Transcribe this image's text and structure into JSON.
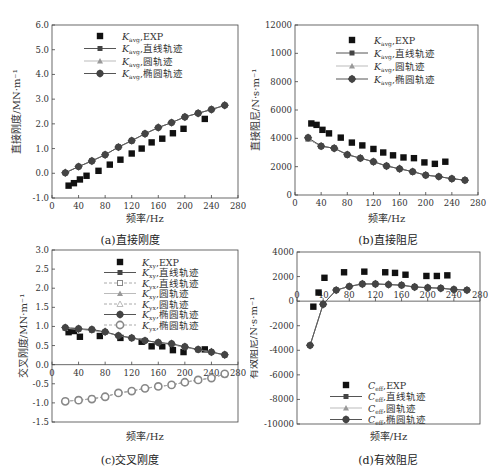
{
  "chart_data": [
    {
      "id": "a",
      "type": "line",
      "caption": "(a)直接刚度",
      "xlabel": "频率/Hz",
      "ylabel": "直接刚度/MN·m⁻¹",
      "xlim": [
        0,
        280
      ],
      "ylim": [
        -1.0,
        6.0
      ],
      "xticks": [
        0,
        40,
        80,
        120,
        160,
        200,
        240,
        280
      ],
      "yticks": [
        -1.0,
        0.0,
        1.0,
        2.0,
        3.0,
        4.0,
        5.0,
        6.0
      ],
      "ytick_labels": [
        "-1.0",
        "0.0",
        "1.0",
        "2.0",
        "3.0",
        "4.0",
        "5.0",
        "6.0"
      ],
      "legend": [
        "K_avg, EXP",
        "K_avg, 直线轨迹",
        "K_avg, 圆轨迹",
        "K_avg, 椭圆轨迹"
      ],
      "series": [
        {
          "name": "K_avg, EXP",
          "style": "square",
          "x": [
            25,
            33,
            42,
            52,
            70,
            87,
            103,
            120,
            135,
            150,
            166,
            182,
            198,
            230
          ],
          "y": [
            -0.5,
            -0.4,
            -0.25,
            -0.1,
            0.1,
            0.35,
            0.55,
            0.8,
            1.0,
            1.25,
            1.4,
            1.62,
            1.8,
            2.2
          ]
        },
        {
          "name": "K_avg, 直线轨迹",
          "style": "line-square",
          "x": [
            20,
            40,
            60,
            80,
            100,
            120,
            140,
            160,
            180,
            200,
            220,
            240,
            260
          ],
          "y": [
            0.02,
            0.27,
            0.5,
            0.75,
            1.06,
            1.32,
            1.6,
            1.85,
            2.05,
            2.28,
            2.43,
            2.58,
            2.75
          ]
        },
        {
          "name": "K_avg, 圆轨迹",
          "style": "line-triangle",
          "x": [
            20,
            40,
            60,
            80,
            100,
            120,
            140,
            160,
            180,
            200,
            220,
            240,
            260
          ],
          "y": [
            0.02,
            0.27,
            0.5,
            0.75,
            1.06,
            1.32,
            1.6,
            1.85,
            2.05,
            2.28,
            2.43,
            2.58,
            2.75
          ]
        },
        {
          "name": "K_avg, 椭圆轨迹",
          "style": "line-diamond",
          "x": [
            20,
            40,
            60,
            80,
            100,
            120,
            140,
            160,
            180,
            200,
            220,
            240,
            260
          ],
          "y": [
            0.02,
            0.27,
            0.5,
            0.75,
            1.06,
            1.32,
            1.6,
            1.85,
            2.05,
            2.28,
            2.43,
            2.58,
            2.75
          ]
        }
      ]
    },
    {
      "id": "b",
      "type": "line",
      "caption": "(b)直接阻尼",
      "xlabel": "频率/Hz",
      "ylabel": "直接阻尼/N·s·m⁻¹",
      "xlim": [
        0,
        280
      ],
      "ylim": [
        0,
        12000
      ],
      "xticks": [
        0,
        40,
        80,
        120,
        160,
        200,
        240,
        280
      ],
      "yticks": [
        0,
        2000,
        4000,
        6000,
        8000,
        10000,
        12000
      ],
      "ytick_labels": [
        "0",
        "2000",
        "4000",
        "6000",
        "8000",
        "1000",
        "12000"
      ],
      "legend": [
        "K_avg, EXP",
        "K_avg, 直线轨迹",
        "K_avg, 圆轨迹",
        "K_avg, 椭圆轨迹"
      ],
      "series": [
        {
          "name": "K_avg, EXP",
          "style": "square",
          "x": [
            25,
            33,
            42,
            52,
            70,
            87,
            103,
            120,
            135,
            150,
            166,
            182,
            198,
            214,
            230
          ],
          "y": [
            5050,
            4950,
            4600,
            4350,
            4050,
            3700,
            3500,
            3250,
            3000,
            2800,
            2650,
            2600,
            2300,
            2200,
            2350
          ]
        },
        {
          "name": "K_avg, 直线轨迹",
          "style": "line-square",
          "x": [
            20,
            40,
            60,
            80,
            100,
            120,
            140,
            160,
            180,
            200,
            220,
            240,
            260
          ],
          "y": [
            3950,
            3450,
            3300,
            2850,
            2600,
            2350,
            2050,
            1850,
            1650,
            1400,
            1300,
            1150,
            1050
          ]
        },
        {
          "name": "K_avg, 圆轨迹",
          "style": "line-triangle",
          "x": [
            20,
            40,
            60,
            80,
            100,
            120,
            140,
            160,
            180,
            200,
            220,
            240,
            260
          ],
          "y": [
            3950,
            3450,
            3300,
            2850,
            2600,
            2350,
            2050,
            1850,
            1650,
            1400,
            1300,
            1150,
            1050
          ]
        },
        {
          "name": "K_avg, 椭圆轨迹",
          "style": "line-diamond",
          "x": [
            20,
            40,
            60,
            80,
            100,
            120,
            140,
            160,
            180,
            200,
            220,
            240,
            260
          ],
          "y": [
            4050,
            3450,
            3300,
            2850,
            2600,
            2350,
            2050,
            1850,
            1650,
            1400,
            1300,
            1150,
            1050
          ]
        }
      ]
    },
    {
      "id": "c",
      "type": "line",
      "caption": "(c)交叉刚度",
      "xlabel": "频率/Hz",
      "ylabel": "交叉刚度/MN·m⁻¹",
      "xlim": [
        0,
        280
      ],
      "ylim": [
        -1.5,
        3.0
      ],
      "xticks": [
        0,
        40,
        80,
        120,
        160,
        200,
        240,
        280
      ],
      "yticks": [
        -1.5,
        -1.0,
        -0.5,
        0.0,
        0.5,
        1.0,
        1.5,
        2.0,
        2.5,
        3.0
      ],
      "ytick_labels": [
        "-1.5",
        "-1.0",
        "-0.5",
        "0.0",
        "0.5",
        "1.0",
        "1.5",
        "2.0",
        "2.5",
        "3.0"
      ],
      "legend": [
        "K_xy, EXP",
        "K_xy, 直线轨迹",
        "K_yx, 直线轨迹",
        "K_xy, 圆轨迹",
        "K_yx, 圆轨迹",
        "K_xy, 椭圆轨迹",
        "K_yx, 椭圆轨迹"
      ],
      "series": [
        {
          "name": "K_xy, EXP",
          "style": "square",
          "x": [
            25,
            33,
            42,
            72,
            103,
            135,
            150,
            166,
            182,
            198,
            230
          ],
          "y": [
            0.85,
            0.88,
            0.73,
            0.75,
            0.7,
            0.6,
            0.48,
            0.48,
            0.38,
            0.33,
            0.4
          ]
        },
        {
          "name": "K_xy, 直线轨迹",
          "style": "line-square",
          "x": [
            20,
            40,
            60,
            80,
            100,
            120,
            140,
            160,
            180,
            200,
            220,
            240,
            260
          ],
          "y": [
            0.95,
            0.93,
            0.9,
            0.85,
            0.76,
            0.7,
            0.63,
            0.58,
            0.53,
            0.46,
            0.39,
            0.33,
            0.25
          ]
        },
        {
          "name": "K_yx, 直线轨迹",
          "style": "dash-square-open",
          "x": [
            20,
            40,
            60,
            80,
            100,
            120,
            140,
            160,
            180,
            200,
            220,
            240,
            260
          ],
          "y": [
            -0.95,
            -0.93,
            -0.89,
            -0.84,
            -0.74,
            -0.69,
            -0.62,
            -0.57,
            -0.53,
            -0.46,
            -0.4,
            -0.35,
            -0.25
          ]
        },
        {
          "name": "K_xy, 圆轨迹",
          "style": "line-triangle",
          "x": [
            20,
            40,
            60,
            80,
            100,
            120,
            140,
            160,
            180,
            200,
            220,
            240,
            260
          ],
          "y": [
            0.95,
            0.93,
            0.9,
            0.85,
            0.76,
            0.7,
            0.63,
            0.58,
            0.53,
            0.46,
            0.39,
            0.33,
            0.25
          ]
        },
        {
          "name": "K_yx, 圆轨迹",
          "style": "dash-triangle-open",
          "x": [
            20,
            40,
            60,
            80,
            100,
            120,
            140,
            160,
            180,
            200,
            220,
            240,
            260
          ],
          "y": [
            -0.95,
            -0.93,
            -0.89,
            -0.84,
            -0.74,
            -0.69,
            -0.62,
            -0.57,
            -0.53,
            -0.46,
            -0.4,
            -0.35,
            -0.25
          ]
        },
        {
          "name": "K_xy, 椭圆轨迹",
          "style": "line-diamond",
          "x": [
            20,
            40,
            60,
            80,
            100,
            120,
            140,
            160,
            180,
            200,
            220,
            240,
            260
          ],
          "y": [
            0.97,
            0.94,
            0.92,
            0.86,
            0.76,
            0.7,
            0.63,
            0.58,
            0.55,
            0.47,
            0.4,
            0.33,
            0.26
          ]
        },
        {
          "name": "K_yx, 椭圆轨迹",
          "style": "dash-diamond-open",
          "x": [
            20,
            40,
            60,
            80,
            100,
            120,
            140,
            160,
            180,
            200,
            220,
            240,
            260
          ],
          "y": [
            -0.96,
            -0.93,
            -0.9,
            -0.84,
            -0.74,
            -0.69,
            -0.62,
            -0.57,
            -0.53,
            -0.46,
            -0.4,
            -0.35,
            -0.24
          ]
        }
      ]
    },
    {
      "id": "d",
      "type": "line",
      "caption": "(d)有效阻尼",
      "xlabel": "频率/Hz",
      "ylabel": "有效阻尼/N·s·m⁻¹",
      "xlim": [
        0,
        280
      ],
      "ylim": [
        -10000,
        4000
      ],
      "xticks": [
        0,
        40,
        80,
        120,
        160,
        200,
        240,
        280
      ],
      "yticks": [
        -10000,
        -8000,
        -6000,
        -4000,
        -2000,
        0,
        2000,
        4000
      ],
      "ytick_labels": [
        "-10000",
        "-8000",
        "-6000",
        "-4000",
        "-2000",
        "0",
        "2000",
        "4000"
      ],
      "legend": [
        "C_eff, EXP",
        "C_eff, 直线轨迹",
        "C_eff, 圆轨迹",
        "C_eff, 椭圆轨迹"
      ],
      "series": [
        {
          "name": "C_eff, EXP",
          "style": "square",
          "x": [
            25,
            33,
            42,
            72,
            103,
            135,
            150,
            166,
            198,
            214,
            230
          ],
          "y": [
            -450,
            700,
            1900,
            2350,
            2400,
            2350,
            2300,
            2150,
            2050,
            2050,
            2100
          ]
        },
        {
          "name": "C_eff, 直线轨迹",
          "style": "line-square",
          "x": [
            20,
            40,
            60,
            80,
            100,
            120,
            140,
            160,
            180,
            200,
            220,
            240,
            260
          ],
          "y": [
            -3600,
            -250,
            900,
            1200,
            1400,
            1400,
            1350,
            1300,
            1150,
            1100,
            1050,
            950,
            900
          ]
        },
        {
          "name": "C_eff, 圆轨迹",
          "style": "line-triangle",
          "x": [
            20,
            40,
            60,
            80,
            100,
            120,
            140,
            160,
            180,
            200,
            220,
            240,
            260
          ],
          "y": [
            -3600,
            -250,
            900,
            1200,
            1400,
            1400,
            1350,
            1300,
            1150,
            1100,
            1050,
            950,
            900
          ]
        },
        {
          "name": "C_eff, 椭圆轨迹",
          "style": "line-diamond",
          "x": [
            20,
            40,
            60,
            80,
            100,
            120,
            140,
            160,
            180,
            200,
            220,
            240,
            260
          ],
          "y": [
            -3600,
            -250,
            900,
            1200,
            1400,
            1400,
            1350,
            1300,
            1150,
            1100,
            1050,
            950,
            900
          ]
        }
      ]
    }
  ],
  "panels": {
    "a": {
      "caption": "(a)直接刚度",
      "xlabel": "频率/Hz",
      "ylabel": "直接刚度/MN·m⁻¹"
    },
    "b": {
      "caption": "(b)直接阻尼",
      "xlabel": "频率/Hz",
      "ylabel": "直接阻尼/N·s·m⁻¹"
    },
    "c": {
      "caption": "(c)交叉刚度",
      "xlabel": "频率/Hz",
      "ylabel": "交叉刚度/MN·m⁻¹"
    },
    "d": {
      "caption": "(d)有效阻尼",
      "xlabel": "频率/Hz",
      "ylabel": "有效阻尼/N·s·m⁻¹"
    }
  },
  "colors": {
    "axis": "#444444",
    "exp_marker": "#111111",
    "sim_line": "#555555",
    "sim_marker": "#444444",
    "sim_line_light": "#aaaaaa",
    "dashed_marker": "#888888"
  }
}
